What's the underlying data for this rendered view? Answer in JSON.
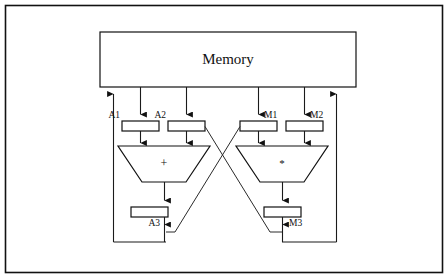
{
  "diagram": {
    "title": "Memory",
    "frame": {
      "label": "outer-border"
    },
    "memory": {
      "label": "Memory",
      "x": 100,
      "y": 32,
      "width": 256,
      "height": 55
    },
    "registers": [
      {
        "id": "A1",
        "label": "A1",
        "label_side": "left",
        "x": 122,
        "y": 121,
        "width": 37,
        "height": 10
      },
      {
        "id": "A2",
        "label": "A2",
        "label_side": "left",
        "x": 168,
        "y": 121,
        "width": 37,
        "height": 10
      },
      {
        "id": "M1",
        "label": "M1",
        "label_side": "right",
        "x": 240,
        "y": 121,
        "width": 37,
        "height": 10
      },
      {
        "id": "M2",
        "label": "M2",
        "label_side": "right",
        "x": 286,
        "y": 121,
        "width": 37,
        "height": 10
      },
      {
        "id": "A3",
        "label": "A3",
        "label_side": "left",
        "x": 131,
        "y": 207,
        "width": 37,
        "height": 10
      },
      {
        "id": "M3",
        "label": "M3",
        "label_side": "right",
        "x": 264,
        "y": 207,
        "width": 37,
        "height": 10
      }
    ],
    "units": [
      {
        "id": "adder",
        "op": "+",
        "symbol_name": "plus-symbol",
        "top_left": 118,
        "top_right": 210,
        "bottom_left": 142,
        "bottom_right": 186,
        "top_y": 146,
        "bottom_y": 182
      },
      {
        "id": "multiplier",
        "op": "*",
        "symbol_name": "asterisk-symbol",
        "top_left": 236,
        "top_right": 328,
        "bottom_left": 260,
        "bottom_right": 304,
        "top_y": 146,
        "bottom_y": 182
      }
    ],
    "colors": {
      "line": "#111111",
      "fill": "#ffffff",
      "background": "#ffffff"
    },
    "notes": {
      "crossover": "A2 output crosses to multiplier input; M1 output crosses to adder input",
      "feedback_left": "A3 result bus returns to Memory on the left",
      "feedback_right": "M3 result bus returns to Memory on the right"
    }
  }
}
